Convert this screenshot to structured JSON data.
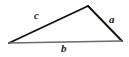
{
  "figure": {
    "type": "geometry-diagram",
    "shape": "triangle",
    "background_color": "#ffffff",
    "stroke_color_sides": "#111111",
    "stroke_color_base": "#6b6b6b",
    "label_color": "#1a1a1a",
    "vertices": [
      {
        "name": "left-vertex",
        "x": 9,
        "y": 43
      },
      {
        "name": "apex-vertex",
        "x": 88,
        "y": 6
      },
      {
        "name": "right-vertex",
        "x": 122,
        "y": 41
      }
    ],
    "sides": [
      {
        "id": "side-c",
        "label": "c",
        "from": "left-vertex",
        "to": "apex-vertex",
        "stroke": "#111111",
        "stroke_width": 1.9
      },
      {
        "id": "side-a",
        "label": "a",
        "from": "apex-vertex",
        "to": "right-vertex",
        "stroke": "#111111",
        "stroke_width": 1.9
      },
      {
        "id": "side-b",
        "label": "b",
        "from": "left-vertex",
        "to": "right-vertex",
        "stroke": "#6b6b6b",
        "stroke_width": 1.3
      }
    ],
    "labels": {
      "c": "c",
      "a": "a",
      "b": "b"
    }
  }
}
